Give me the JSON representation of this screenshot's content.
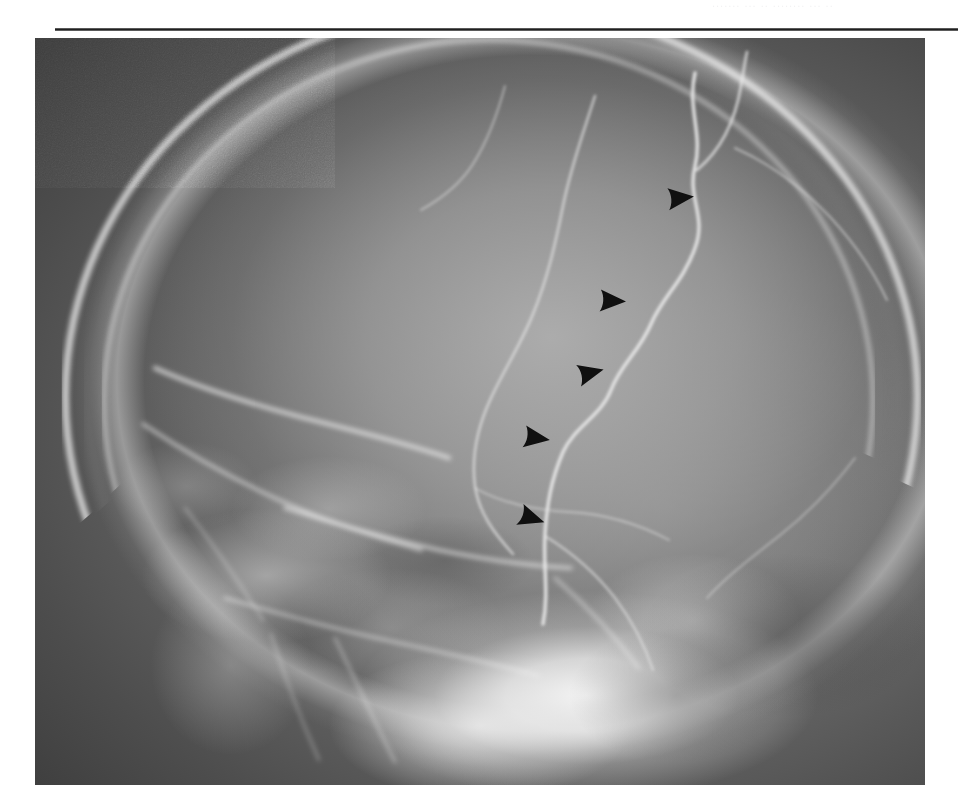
{
  "page": {
    "width": 958,
    "height": 810,
    "background_color": "#ffffff",
    "header_remnant_text": "....... ... .. ........ ... ..",
    "rule": {
      "color": "#1d1d1d",
      "left": 55,
      "top": 28,
      "width": 903,
      "height": 3
    }
  },
  "figure": {
    "kind": "radiograph",
    "modality": "plain-film-radiograph",
    "view": "lateral-skull",
    "frame": {
      "left": 35,
      "top": 38,
      "width": 890,
      "height": 747
    },
    "colors": {
      "film_dark": "#2b2b2b",
      "bone_bright": "#fafafa",
      "parenchyma_mid": "#9e9e9e",
      "marker_black": "#101010"
    },
    "annotations": {
      "marker_shape": "solid-black-arrowhead",
      "marker_direction": "pointing-right",
      "marker_count": 5,
      "markers": [
        {
          "id": 1,
          "x": 680,
          "y": 172,
          "rotation": -6
        },
        {
          "id": 2,
          "x": 612,
          "y": 275,
          "rotation": 2
        },
        {
          "id": 3,
          "x": 590,
          "y": 347,
          "rotation": -14
        },
        {
          "id": 4,
          "x": 536,
          "y": 412,
          "rotation": 8
        },
        {
          "id": 5,
          "x": 531,
          "y": 492,
          "rotation": 18
        }
      ]
    },
    "structures": [
      {
        "name": "calvarium-outer-table",
        "appearance": "bright-curved-band"
      },
      {
        "name": "calvarium-inner-table",
        "appearance": "bright-curved-band"
      },
      {
        "name": "diploic-space",
        "appearance": "grey-band-between-tables"
      },
      {
        "name": "scalp-soft-tissue",
        "appearance": "faint-outer-halo"
      },
      {
        "name": "parietal-lucent-line",
        "appearance": "serpiginous-bright-line"
      },
      {
        "name": "vascular-groove-branch",
        "appearance": "branching-lucent-line"
      },
      {
        "name": "frontal-sinus",
        "appearance": "dark-air-cell"
      },
      {
        "name": "orbital-roof",
        "appearance": "bright-linear-density"
      },
      {
        "name": "petrous-skull-base",
        "appearance": "dense-bright-mass"
      },
      {
        "name": "mastoid-air-cells",
        "appearance": "mottled-lucency"
      },
      {
        "name": "posterior-fossa",
        "appearance": "mid-grey-region"
      }
    ]
  }
}
